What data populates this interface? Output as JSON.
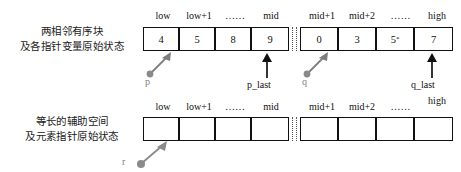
{
  "diagram": {
    "title_top": "两相邻有序块",
    "captions": {
      "top_line1": "两相邻有序块",
      "top_line2": "及各指针变量原始状态",
      "bottom_line1": "等长的辅助空间",
      "bottom_line2": "及元素指针原始状态"
    },
    "headers": {
      "left": [
        "low",
        "low+1",
        "……",
        "mid"
      ],
      "right": [
        "mid+1",
        "mid+2",
        "……",
        "high"
      ]
    },
    "rows": [
      {
        "name": "source-array",
        "left_cells": [
          "4",
          "5",
          "8",
          "9"
        ],
        "right_cells": [
          "0",
          "3",
          "5*",
          "7"
        ]
      },
      {
        "name": "auxiliary-array",
        "left_cells": [
          "",
          "",
          "",
          ""
        ],
        "right_cells": [
          "",
          "",
          "",
          ""
        ]
      }
    ],
    "pointers": {
      "p": "p",
      "p_last": "p_last",
      "q": "q",
      "q_last": "q_last",
      "r": "r"
    },
    "colors": {
      "ink": "#111111",
      "gray_pointer": "#7d7d7d",
      "background": "#ffffff"
    }
  }
}
